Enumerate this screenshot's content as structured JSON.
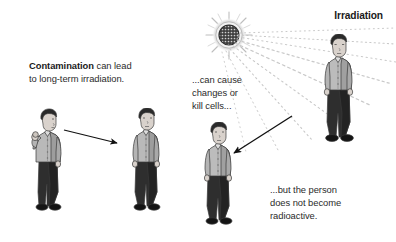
{
  "canvas": {
    "width": 396,
    "height": 242,
    "background": "#ffffff"
  },
  "title": {
    "irradiation_label": "Irradiation"
  },
  "captions": {
    "contamination_bold": "Contamination",
    "contamination_rest": " can lead\nto long-term irradiation.",
    "cause_changes": "...can cause\nchanges or\nkill cells...",
    "not_radioactive": "...but the person\ndoes not become\nradioactive."
  },
  "icons": {
    "radiation_source": "radiation-source-icon",
    "arrow_contamination": "arrow-icon",
    "arrow_irradiation": "arrow-icon",
    "rays": "radiation-rays-icon"
  },
  "figures": [
    {
      "name": "contaminated-person-holding-object",
      "pose": "hand-raised"
    },
    {
      "name": "contaminated-person-standing",
      "pose": "standing"
    },
    {
      "name": "irradiated-person-standing",
      "pose": "standing"
    },
    {
      "name": "source-person-standing",
      "pose": "standing"
    }
  ],
  "colors": {
    "text": "#2b2b2b",
    "text_bold": "#1a1a1a",
    "shirt": "#b8b8b8",
    "shirt_shadow": "#8e8e8e",
    "pants": "#2e2e2e",
    "pants_shadow": "#151515",
    "hair": "#2a2a2a",
    "skin": "#d9d2cc",
    "shoes": "#1a1a1a",
    "outline": "#3a3a3a",
    "ray": "#c9c9c9",
    "arrow": "#111111",
    "source_core": "#3d3d3d",
    "source_ring": "#d4d4d4"
  }
}
